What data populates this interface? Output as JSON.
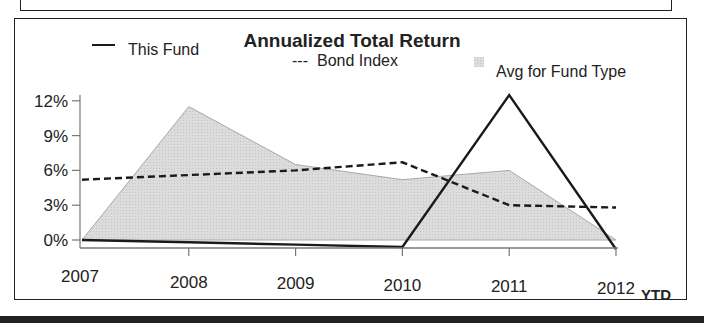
{
  "chart_data": {
    "type": "line",
    "title": "Annualized Total Return",
    "xlabel": "",
    "ylabel": "",
    "categories": [
      "2007",
      "2008",
      "2009",
      "2010",
      "2011",
      "2012"
    ],
    "x_suffix_label": "YTD",
    "yticks": [
      "0%",
      "3%",
      "6%",
      "9%",
      "12%"
    ],
    "ytick_values": [
      0,
      3,
      6,
      9,
      12
    ],
    "ylim": [
      0,
      12
    ],
    "grid": false,
    "legend_position": "top",
    "series": [
      {
        "name": "This Fund",
        "style": "solid",
        "values": [
          0,
          -0.2,
          -0.4,
          -0.6,
          12.5,
          -0.8
        ]
      },
      {
        "name": "Bond Index",
        "style": "dashed",
        "values": [
          5.2,
          5.6,
          6.0,
          6.7,
          3.0,
          2.8
        ]
      },
      {
        "name": "Avg for Fund Type",
        "style": "area",
        "values": [
          0,
          11.5,
          6.5,
          5.2,
          6.0,
          0
        ]
      }
    ],
    "legend": [
      {
        "label": "This Fund",
        "marker": "—"
      },
      {
        "label": "Bond Index",
        "marker": "---"
      },
      {
        "label": "Avg for Fund Type",
        "marker": "swatch"
      }
    ],
    "colors": {
      "line": "#1a1a1a",
      "area_fill": "#dcdcdc",
      "area_edge": "#a8a8a8"
    }
  }
}
